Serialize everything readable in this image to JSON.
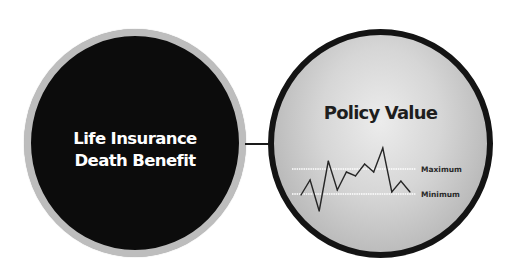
{
  "left_circle": {
    "line1": "Life Insurance",
    "line2": "Death Benefit",
    "fill_color": "#0c0c0c",
    "ring_color": "#bdbdbd",
    "text_color": "#ffffff"
  },
  "right_circle": {
    "title": "Policy Value",
    "fill_color": "#d6d6d6",
    "ring_color": "#141414",
    "text_color": "#1e1e1e"
  },
  "connector": {
    "color": "#1a1a1a"
  },
  "chart_data": {
    "type": "line",
    "title": "Policy Value",
    "xlabel": "",
    "ylabel": "",
    "reference_lines": [
      {
        "label": "Maximum",
        "value": 1.0,
        "color": "#ffffff",
        "style": "dotted"
      },
      {
        "label": "Minimum",
        "value": 0.0,
        "color": "#ffffff",
        "style": "dotted"
      }
    ],
    "series": [
      {
        "name": "Policy Value",
        "color": "#262626",
        "x": [
          0,
          1,
          2,
          3,
          4,
          5,
          6,
          7,
          8,
          9,
          10,
          11,
          12
        ],
        "values": [
          -0.04,
          0.56,
          -0.68,
          1.32,
          0.16,
          0.88,
          0.72,
          1.2,
          0.88,
          1.84,
          0.08,
          0.52,
          0.08
        ]
      }
    ],
    "ylim": [
      -0.8,
      2.0
    ],
    "grid": false,
    "legend": "none"
  }
}
